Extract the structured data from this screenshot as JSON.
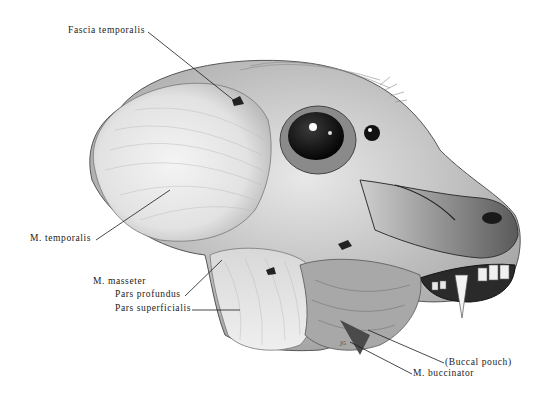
{
  "figure": {
    "labels": [
      {
        "id": "fascia-temporalis",
        "text": "Fascia temporalis"
      },
      {
        "id": "m-temporalis",
        "text": "M. temporalis"
      },
      {
        "id": "m-masseter",
        "text": "M. masseter"
      },
      {
        "id": "pars-profundus",
        "text": "Pars profundus"
      },
      {
        "id": "pars-superficialis",
        "text": "Pars superficialis"
      },
      {
        "id": "buccal-pouch",
        "text": "(Buccal pouch)"
      },
      {
        "id": "m-buccinator",
        "text": "M. buccinator"
      }
    ],
    "signature": "JG"
  }
}
